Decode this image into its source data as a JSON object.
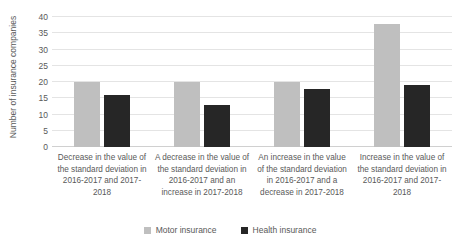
{
  "chart_data": {
    "type": "bar",
    "title": "",
    "subtitle": "",
    "xlabel": "",
    "ylabel": "Number of insurance companies",
    "ylim": [
      0,
      40
    ],
    "ytick_labels": [
      "0",
      "5",
      "10",
      "15",
      "20",
      "25",
      "30",
      "35",
      "40"
    ],
    "ytick_values": [
      0,
      5,
      10,
      15,
      20,
      25,
      30,
      35,
      40
    ],
    "grid": true,
    "legend_position": "bottom",
    "categories": [
      "Decrease in the value of the standard deviation in 2016-2017 and 2017-2018",
      "A decrease in the value of the standard deviation in 2016-2017 and an increase in 2017-2018",
      "An increase in the value of the standard deviation in 2016-2017 and a decrease in 2017-2018",
      "Increase in the value of the standard deviation in 2016-2017 and 2017-2018"
    ],
    "series": [
      {
        "name": "Motor insurance",
        "color": "#bfbfbf",
        "values": [
          20,
          20,
          20,
          38
        ]
      },
      {
        "name": "Health insurance",
        "color": "#262626",
        "values": [
          16,
          13,
          18,
          19
        ]
      }
    ]
  },
  "legend": {
    "items": [
      {
        "label": "Motor insurance",
        "color": "#bfbfbf"
      },
      {
        "label": "Health insurance",
        "color": "#262626"
      }
    ]
  },
  "colors": {
    "grid": "#e4e4e4",
    "text": "#595959",
    "background": "#ffffff"
  }
}
